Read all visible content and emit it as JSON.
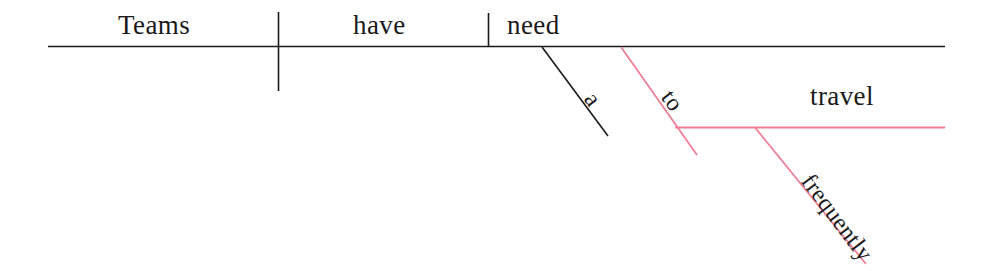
{
  "diagram": {
    "type": "reed-kellogg-sentence-diagram",
    "sentence": "Teams have a need to travel frequently",
    "colors": {
      "rule_primary": "#1a1a1a",
      "rule_secondary": "#ef7f97",
      "text": "#1a1a1a",
      "background": "#ffffff"
    },
    "baseline": {
      "subject": "Teams",
      "verb": "have",
      "object": "need"
    },
    "branches": {
      "article": "a",
      "infinitive_marker": "to",
      "infinitive_verb": "travel",
      "adverb": "frequently"
    }
  }
}
